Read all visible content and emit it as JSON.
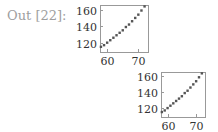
{
  "cell": {
    "prompt_label": "Out [22]:"
  },
  "style": {
    "frame_color": "#999999",
    "marker_color": "#555555",
    "tick_label_color": "#333333",
    "prompt_color": "#9e9e9e"
  },
  "chart_data": [
    {
      "type": "scatter",
      "title": "",
      "xlabel": "",
      "ylabel": "",
      "x": [
        58,
        59,
        60,
        61,
        62,
        63,
        64,
        65,
        66,
        67,
        68,
        69,
        70,
        71,
        72
      ],
      "y": [
        115,
        117,
        120,
        123,
        126,
        129,
        132,
        135,
        139,
        142,
        146,
        150,
        154,
        159,
        164
      ],
      "x_ticks": [
        60,
        70
      ],
      "y_ticks": [
        120,
        140,
        160
      ],
      "xlim": [
        57.7,
        73.1
      ],
      "ylim": [
        108.7,
        165.7
      ],
      "grid": false,
      "legend": null
    },
    {
      "type": "scatter",
      "title": "",
      "xlabel": "",
      "ylabel": "",
      "x": [
        58,
        59,
        60,
        61,
        62,
        63,
        64,
        65,
        66,
        67,
        68,
        69,
        70,
        71,
        72
      ],
      "y": [
        115,
        117,
        120,
        123,
        126,
        129,
        132,
        135,
        139,
        142,
        146,
        150,
        154,
        159,
        164
      ],
      "x_ticks": [
        60,
        70
      ],
      "y_ticks": [
        120,
        140,
        160
      ],
      "xlim": [
        57.7,
        73.1
      ],
      "ylim": [
        108.7,
        165.7
      ],
      "grid": false,
      "legend": null
    }
  ]
}
